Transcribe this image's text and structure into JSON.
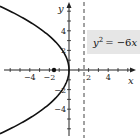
{
  "chart_data": {
    "type": "line",
    "title": "",
    "equation": {
      "lhs_var": "y",
      "lhs_exp": "2",
      "rhs": "= −6",
      "rhs_var": "x"
    },
    "xlabel": "x",
    "ylabel": "y",
    "xlim": [
      -6.5,
      6.5
    ],
    "ylim": [
      -6.5,
      7
    ],
    "x_ticks": [
      -6,
      -5,
      -4,
      -3,
      -2,
      -1,
      1,
      2,
      3,
      4,
      5,
      6
    ],
    "x_tick_labels": [
      {
        "value": -4,
        "label": "−4"
      },
      {
        "value": -2,
        "label": "−2"
      },
      {
        "value": 2,
        "label": "2"
      },
      {
        "value": 4,
        "label": "4"
      }
    ],
    "y_ticks": [
      -6,
      -5,
      -4,
      -3,
      -2,
      -1,
      1,
      2,
      3,
      4,
      5,
      6
    ],
    "y_tick_labels": [
      {
        "value": 4,
        "label": "4"
      },
      {
        "value": 2,
        "label": "2"
      },
      {
        "value": -2,
        "label": "−2"
      },
      {
        "value": -4,
        "label": "−4"
      }
    ],
    "series": [
      {
        "name": "parabola",
        "equation": "y^2 = -6x",
        "style": "solid",
        "points": [
          [
            -6.6,
            6.3
          ],
          [
            -5.4,
            5.7
          ],
          [
            -4.17,
            5
          ],
          [
            -2.67,
            4
          ],
          [
            -1.5,
            3
          ],
          [
            -0.67,
            2
          ],
          [
            -0.17,
            1
          ],
          [
            0,
            0
          ],
          [
            -0.17,
            -1
          ],
          [
            -0.67,
            -2
          ],
          [
            -1.5,
            -3
          ],
          [
            -2.67,
            -4
          ],
          [
            -4.17,
            -5
          ],
          [
            -5.4,
            -5.7
          ],
          [
            -6.6,
            -6.3
          ]
        ]
      },
      {
        "name": "directrix",
        "equation": "x = 1.5",
        "style": "dashed"
      }
    ],
    "annotations": [
      {
        "type": "point",
        "name": "focus",
        "x": -1.5,
        "y": 0
      }
    ],
    "grid": false,
    "legend": "none"
  }
}
